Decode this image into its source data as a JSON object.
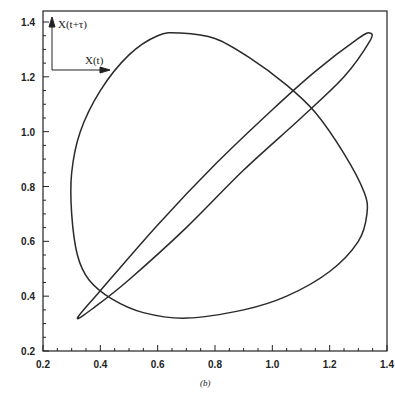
{
  "chart_data": {
    "type": "line",
    "title": "",
    "caption": "(b)",
    "xlabel": "X(t)",
    "ylabel": "X(t+τ)",
    "xlim": [
      0.2,
      1.4
    ],
    "ylim": [
      0.2,
      1.4
    ],
    "grid": false,
    "legend": "none",
    "x_ticks": [
      "0.2",
      "0.4",
      "0.6",
      "0.8",
      "1.0",
      "1.2",
      "1.4"
    ],
    "y_ticks": [
      "0.2",
      "0.4",
      "0.6",
      "0.8",
      "1.0",
      "1.2",
      "1.4"
    ],
    "series": [
      {
        "name": "large loop (phase portrait)",
        "points": [
          [
            0.68,
            1.36
          ],
          [
            0.8,
            1.34
          ],
          [
            0.92,
            1.27
          ],
          [
            1.05,
            1.17
          ],
          [
            1.15,
            1.07
          ],
          [
            1.25,
            0.92
          ],
          [
            1.32,
            0.78
          ],
          [
            1.33,
            0.7
          ],
          [
            1.3,
            0.6
          ],
          [
            1.2,
            0.49
          ],
          [
            1.05,
            0.4
          ],
          [
            0.9,
            0.35
          ],
          [
            0.7,
            0.32
          ],
          [
            0.55,
            0.34
          ],
          [
            0.44,
            0.39
          ],
          [
            0.36,
            0.46
          ],
          [
            0.32,
            0.55
          ],
          [
            0.3,
            0.7
          ],
          [
            0.3,
            0.85
          ],
          [
            0.33,
            1.0
          ],
          [
            0.4,
            1.15
          ],
          [
            0.5,
            1.28
          ],
          [
            0.6,
            1.35
          ],
          [
            0.68,
            1.36
          ]
        ]
      },
      {
        "name": "thin ellipse",
        "points": [
          [
            0.32,
            0.32
          ],
          [
            0.4,
            0.42
          ],
          [
            0.6,
            0.66
          ],
          [
            0.8,
            0.88
          ],
          [
            1.0,
            1.08
          ],
          [
            1.15,
            1.22
          ],
          [
            1.3,
            1.34
          ],
          [
            1.34,
            1.36
          ],
          [
            1.34,
            1.33
          ],
          [
            1.25,
            1.2
          ],
          [
            1.1,
            1.05
          ],
          [
            0.9,
            0.86
          ],
          [
            0.7,
            0.65
          ],
          [
            0.5,
            0.46
          ],
          [
            0.38,
            0.36
          ],
          [
            0.32,
            0.32
          ]
        ]
      }
    ],
    "annotations": [
      "X(t+τ)",
      "X(t)",
      "(b)"
    ]
  }
}
